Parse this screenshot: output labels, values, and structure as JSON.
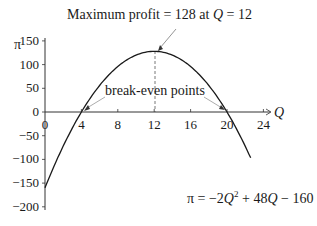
{
  "chart_data": {
    "type": "line",
    "title": "",
    "xlabel": "Q",
    "ylabel": "π",
    "xlim": [
      0,
      24
    ],
    "ylim": [
      -200,
      150
    ],
    "x_ticks": [
      0,
      4,
      8,
      12,
      16,
      20,
      24
    ],
    "y_ticks": [
      150,
      100,
      50,
      0,
      -50,
      -100,
      -150,
      -200
    ],
    "grid": false,
    "series": [
      {
        "name": "π = −2Q² + 48Q − 160",
        "x": [
          0,
          2,
          4,
          6,
          8,
          10,
          12,
          14,
          16,
          18,
          20,
          22,
          24
        ],
        "values": [
          -160,
          -72,
          0,
          56,
          96,
          120,
          128,
          120,
          96,
          56,
          0,
          -72,
          -160
        ]
      }
    ],
    "annotations": [
      {
        "text": "Maximum profit = 128 at Q = 12",
        "x": 12,
        "y": 128
      },
      {
        "text": "break-even points",
        "points": [
          [
            4,
            0
          ],
          [
            20,
            0
          ]
        ]
      },
      {
        "text": "π = −2Q² + 48Q − 160",
        "label_for": "curve"
      }
    ]
  },
  "labels": {
    "y_axis": "π",
    "x_axis": "Q",
    "max_annotation_prefix": "Maximum profit = 128 at ",
    "max_annotation_q": "Q",
    "max_annotation_suffix": " = 12",
    "break_even": "break-even points",
    "eq_pi": "π = −2",
    "eq_q1": "Q",
    "eq_sup": "2",
    "eq_mid": " + 48",
    "eq_q2": "Q",
    "eq_end": " − 160",
    "x_ticks": [
      "0",
      "4",
      "8",
      "12",
      "16",
      "20",
      "24"
    ],
    "y_ticks": [
      "150",
      "100",
      "50",
      "0",
      "−50",
      "−100",
      "−150",
      "−200"
    ]
  }
}
